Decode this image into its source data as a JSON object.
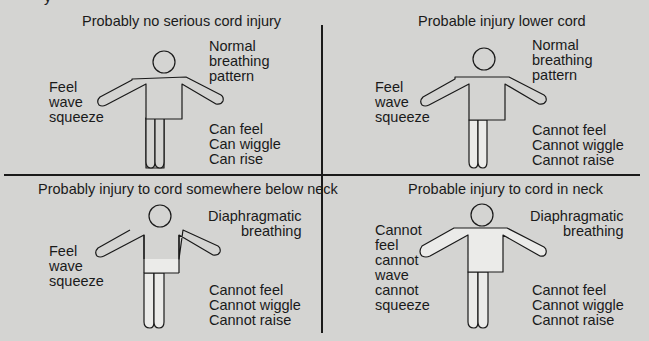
{
  "header_fragment": "y",
  "colors": {
    "background": "#d4d4d2",
    "line": "#1a1a1a",
    "paralysis_fill": "#ebebe9",
    "body_fill": "#d4d4d2"
  },
  "panels": [
    {
      "title": "Probably no serious cord injury",
      "arms_label": "Feel\nwave\nsqueeze",
      "breathing_label": "Normal\nbreathing\npattern",
      "legs_label": "Can feel\nCan wiggle\nCan rise",
      "shaded_regions": []
    },
    {
      "title": "Probable injury lower cord",
      "arms_label": "Feel\nwave\nsqueeze",
      "breathing_label": "Normal\nbreathing\npattern",
      "legs_label": "Cannot feel\nCannot wiggle\nCannot raise",
      "shaded_regions": [
        "legs"
      ]
    },
    {
      "title": "Probably injury to cord somewhere below neck",
      "arms_label": "Feel\nwave\nsqueeze",
      "breathing_label": "Diaphragmatic\nbreathing",
      "legs_label": "Cannot feel\nCannot wiggle\nCannot raise",
      "shaded_regions": [
        "legs",
        "lower-torso"
      ]
    },
    {
      "title": "Probable injury to cord in neck",
      "arms_label": "Cannot\nfeel\ncannot\nwave\ncannot\nsqueeze",
      "breathing_label": "Diaphragmatic\nbreathing",
      "legs_label": "Cannot feel\nCannot wiggle\nCannot raise",
      "shaded_regions": [
        "legs",
        "torso",
        "arms"
      ]
    }
  ]
}
